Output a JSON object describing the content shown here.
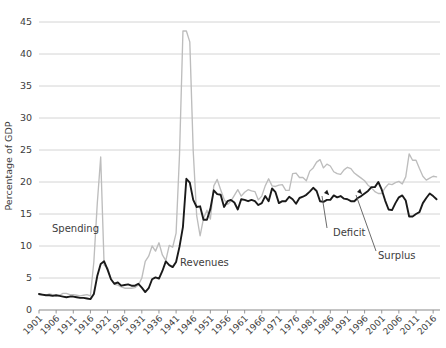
{
  "chart_data": {
    "type": "line",
    "title": "",
    "xlabel": "",
    "ylabel": "Percentage of GDP",
    "xlim": [
      1901,
      2018
    ],
    "ylim": [
      0,
      45
    ],
    "grid": true,
    "legend": "inline-labels",
    "ytick_labels": [
      "0",
      "5",
      "10",
      "15",
      "20",
      "25",
      "30",
      "35",
      "40",
      "45"
    ],
    "ytick_values": [
      0,
      5,
      10,
      15,
      20,
      25,
      30,
      35,
      40,
      45
    ],
    "xtick_labels": [
      "1901",
      "1906",
      "1911",
      "1916",
      "1921",
      "1926",
      "1931",
      "1936",
      "1941",
      "1946",
      "1951",
      "1956",
      "1961",
      "1966",
      "1971",
      "1976",
      "1981",
      "1986",
      "1991",
      "1996",
      "2001",
      "2006",
      "2011",
      "2016"
    ],
    "xtick_values": [
      1901,
      1906,
      1911,
      1916,
      1921,
      1926,
      1931,
      1936,
      1941,
      1946,
      1951,
      1956,
      1961,
      1966,
      1971,
      1976,
      1981,
      1986,
      1991,
      1996,
      2001,
      2006,
      2011,
      2016
    ],
    "series": [
      {
        "name": "Spending",
        "color": "#bdbdbd",
        "label_position": {
          "x": 52,
          "y": 232
        },
        "x": [
          1901,
          1902,
          1903,
          1904,
          1905,
          1906,
          1907,
          1908,
          1909,
          1910,
          1911,
          1912,
          1913,
          1914,
          1915,
          1916,
          1917,
          1918,
          1919,
          1920,
          1921,
          1922,
          1923,
          1924,
          1925,
          1926,
          1927,
          1928,
          1929,
          1930,
          1931,
          1932,
          1933,
          1934,
          1935,
          1936,
          1937,
          1938,
          1939,
          1940,
          1941,
          1942,
          1943,
          1944,
          1945,
          1946,
          1947,
          1948,
          1949,
          1950,
          1951,
          1952,
          1953,
          1954,
          1955,
          1956,
          1957,
          1958,
          1959,
          1960,
          1961,
          1962,
          1963,
          1964,
          1965,
          1966,
          1967,
          1968,
          1969,
          1970,
          1971,
          1972,
          1973,
          1974,
          1975,
          1976,
          1977,
          1978,
          1979,
          1980,
          1981,
          1982,
          1983,
          1984,
          1985,
          1986,
          1987,
          1988,
          1989,
          1990,
          1991,
          1992,
          1993,
          1994,
          1995,
          1996,
          1997,
          1998,
          1999,
          2000,
          2001,
          2002,
          2003,
          2004,
          2005,
          2006,
          2007,
          2008,
          2009,
          2010,
          2011,
          2012,
          2013,
          2014,
          2015,
          2016,
          2017
        ],
        "values": [
          2.4,
          2.3,
          2.3,
          2.5,
          2.4,
          2.2,
          2.3,
          2.6,
          2.6,
          2.4,
          2.4,
          2.3,
          2.2,
          2.3,
          2.4,
          2.2,
          7.5,
          16.6,
          23.9,
          7.0,
          6.6,
          4.8,
          4.0,
          3.9,
          3.6,
          3.4,
          3.4,
          3.4,
          3.5,
          3.9,
          5.0,
          7.6,
          8.4,
          10.0,
          9.2,
          10.5,
          8.6,
          7.7,
          10.1,
          9.8,
          12.0,
          24.3,
          43.6,
          43.6,
          41.9,
          24.8,
          14.8,
          11.6,
          14.3,
          15.6,
          14.2,
          19.4,
          20.4,
          18.8,
          17.3,
          16.5,
          17.0,
          17.9,
          18.8,
          17.8,
          18.4,
          18.8,
          18.6,
          18.5,
          17.2,
          17.8,
          19.4,
          20.5,
          19.4,
          19.3,
          19.5,
          19.6,
          18.7,
          18.7,
          21.3,
          21.4,
          20.7,
          20.7,
          20.2,
          21.7,
          22.2,
          23.1,
          23.5,
          22.2,
          22.8,
          22.5,
          21.6,
          21.3,
          21.2,
          21.9,
          22.3,
          22.1,
          21.4,
          21.0,
          20.6,
          20.2,
          19.5,
          19.1,
          18.5,
          18.2,
          18.2,
          19.1,
          19.7,
          19.6,
          19.9,
          20.1,
          19.7,
          20.8,
          24.4,
          23.4,
          23.4,
          22.1,
          20.9,
          20.3,
          20.6,
          20.9,
          20.8
        ]
      },
      {
        "name": "Revenues",
        "color": "#1a1a1a",
        "label_position": {
          "x": 180,
          "y": 266
        },
        "x": [
          1901,
          1902,
          1903,
          1904,
          1905,
          1906,
          1907,
          1908,
          1909,
          1910,
          1911,
          1912,
          1913,
          1914,
          1915,
          1916,
          1917,
          1918,
          1919,
          1920,
          1921,
          1922,
          1923,
          1924,
          1925,
          1926,
          1927,
          1928,
          1929,
          1930,
          1931,
          1932,
          1933,
          1934,
          1935,
          1936,
          1937,
          1938,
          1939,
          1940,
          1941,
          1942,
          1943,
          1944,
          1945,
          1946,
          1947,
          1948,
          1949,
          1950,
          1951,
          1952,
          1953,
          1954,
          1955,
          1956,
          1957,
          1958,
          1959,
          1960,
          1961,
          1962,
          1963,
          1964,
          1965,
          1966,
          1967,
          1968,
          1969,
          1970,
          1971,
          1972,
          1973,
          1974,
          1975,
          1976,
          1977,
          1978,
          1979,
          1980,
          1981,
          1982,
          1983,
          1984,
          1985,
          1986,
          1987,
          1988,
          1989,
          1990,
          1991,
          1992,
          1993,
          1994,
          1995,
          1996,
          1997,
          1998,
          1999,
          2000,
          2001,
          2002,
          2003,
          2004,
          2005,
          2006,
          2007,
          2008,
          2009,
          2010,
          2011,
          2012,
          2013,
          2014,
          2015,
          2016,
          2017
        ],
        "values": [
          2.5,
          2.4,
          2.3,
          2.3,
          2.2,
          2.3,
          2.2,
          2.1,
          2.0,
          2.1,
          2.1,
          2.0,
          1.9,
          1.9,
          1.8,
          1.7,
          2.5,
          5.3,
          7.2,
          7.6,
          6.3,
          4.8,
          4.1,
          4.3,
          3.8,
          3.9,
          4.0,
          3.8,
          3.8,
          4.1,
          3.5,
          2.8,
          3.4,
          4.8,
          5.1,
          4.9,
          6.1,
          7.6,
          7.0,
          6.7,
          7.5,
          9.9,
          13.0,
          20.5,
          19.9,
          17.2,
          16.1,
          16.2,
          14.1,
          14.1,
          15.8,
          18.7,
          18.1,
          18.0,
          16.1,
          17.0,
          17.2,
          16.8,
          15.7,
          17.3,
          17.2,
          17.0,
          17.2,
          17.0,
          16.4,
          16.7,
          17.8,
          17.0,
          19.0,
          18.4,
          16.7,
          17.0,
          17.0,
          17.7,
          17.3,
          16.6,
          17.5,
          17.7,
          18.0,
          18.5,
          19.1,
          18.6,
          17.0,
          16.9,
          17.2,
          17.2,
          17.9,
          17.6,
          17.8,
          17.4,
          17.3,
          17.0,
          17.0,
          17.5,
          17.8,
          18.2,
          18.6,
          19.2,
          19.2,
          20.0,
          18.8,
          17.1,
          15.7,
          15.6,
          16.7,
          17.6,
          17.9,
          17.1,
          14.6,
          14.6,
          15.0,
          15.3,
          16.7,
          17.5,
          18.2,
          17.8,
          17.3
        ]
      }
    ],
    "annotations": [
      {
        "name": "deficit",
        "label": "Deficit",
        "label_x": 333,
        "label_y": 236,
        "marker_x": 324,
        "marker_y": 193,
        "leader_x1": 327,
        "leader_y1": 228,
        "leader_x2": 322,
        "leader_y2": 196
      },
      {
        "name": "surplus",
        "label": "Surplus",
        "label_x": 378,
        "label_y": 259,
        "marker_x": 357,
        "marker_y": 192,
        "leader_x1": 376,
        "leader_y1": 251,
        "leader_x2": 356,
        "leader_y2": 195
      }
    ]
  },
  "colors": {
    "spending_line": "#bdbdbd",
    "revenues_line": "#1a1a1a",
    "gridline": "#c9c9c9",
    "axis": "#8a8a8a",
    "text": "#3d3d3d",
    "background": "#ffffff"
  }
}
